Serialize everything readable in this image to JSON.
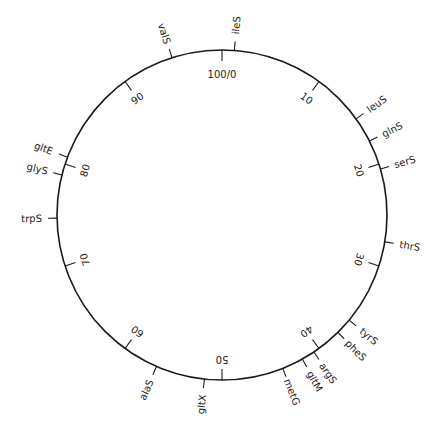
{
  "diagram": {
    "type": "circular-genetic-map",
    "center": [
      222,
      215
    ],
    "radius": 165,
    "stroke_color": "#1a1a1a",
    "scale_ticks": [
      {
        "pos": 0,
        "label": "100/0"
      },
      {
        "pos": 10,
        "label": "10"
      },
      {
        "pos": 20,
        "label": "20"
      },
      {
        "pos": 30,
        "label": "30"
      },
      {
        "pos": 40,
        "label": "40"
      },
      {
        "pos": 50,
        "label": "50"
      },
      {
        "pos": 60,
        "label": "60"
      },
      {
        "pos": 70,
        "label": "70"
      },
      {
        "pos": 80,
        "label": "80"
      },
      {
        "pos": 90,
        "label": "90"
      }
    ],
    "genes": [
      {
        "name": "ileS",
        "pos": 1.2
      },
      {
        "name": "leuS",
        "pos": 15.1
      },
      {
        "name": "glnS",
        "pos": 17.6
      },
      {
        "name": "serS",
        "pos": 20.5
      },
      {
        "name": "thrS",
        "pos": 27.6
      },
      {
        "name": "tyrS",
        "pos": 36.0
      },
      {
        "name": "pheS",
        "pos": 37.6
      },
      {
        "name": "argS",
        "pos": 40.6
      },
      {
        "name": "gltM",
        "pos": 41.9
      },
      {
        "name": "metG",
        "pos": 44.0
      },
      {
        "name": "gltX",
        "pos": 51.7
      },
      {
        "name": "alaS",
        "pos": 56.5
      },
      {
        "name": "trpS",
        "pos": 74.7
      },
      {
        "name": "glyS",
        "pos": 78.9
      },
      {
        "name": "gltE",
        "pos": 80.7
      },
      {
        "name": "valS",
        "pos": 95.1
      }
    ]
  }
}
